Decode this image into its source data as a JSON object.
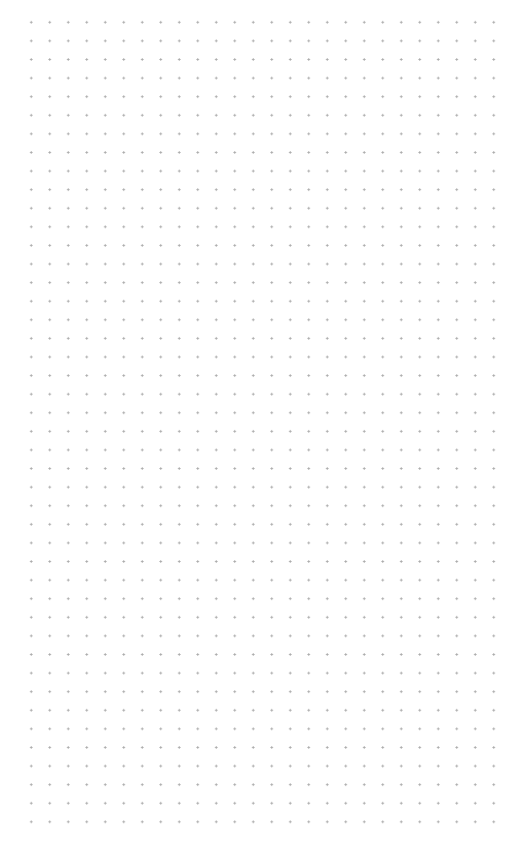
{
  "canvas": {
    "background_color": "#ffffff",
    "grid": {
      "type": "dot-grid",
      "dot_color": "#a8a8a8",
      "columns": 26,
      "rows": 44,
      "spacing_x": 18.5,
      "spacing_y": 18.6,
      "first_dot": [
        31,
        22
      ],
      "last_dot": [
        494,
        822
      ]
    }
  }
}
